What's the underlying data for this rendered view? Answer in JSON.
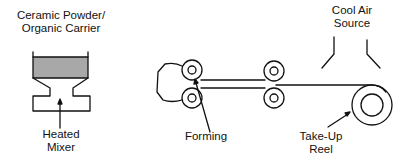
{
  "labels": {
    "mixer_input": {
      "line1": "Ceramic Powder/",
      "line2": "Organic Carrier"
    },
    "mixer": {
      "line1": "Heated",
      "line2": "Mixer"
    },
    "forming": {
      "line1": "Forming"
    },
    "cool_air": {
      "line1": "Cool Air",
      "line2": "Source"
    },
    "reel": {
      "line1": "Take-Up",
      "line2": "Reel"
    }
  },
  "colors": {
    "stroke": "#111111",
    "fill_material": "#a8a8a8",
    "background": "#ffffff"
  }
}
